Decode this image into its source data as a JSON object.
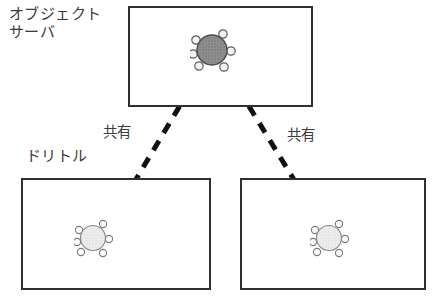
{
  "diagram": {
    "title_labels": {
      "object_server_line1": "オブジェクト",
      "object_server_line2": "サーバ",
      "dolittle": "ドリトル"
    },
    "connection_labels": {
      "left": "共有",
      "right": "共有"
    },
    "boxes": [
      {
        "id": "server",
        "role": "object-server-container",
        "x": 128,
        "y": 6,
        "w": 185,
        "h": 101
      },
      {
        "id": "client-1",
        "role": "dolittle-client-container",
        "x": 21,
        "y": 178,
        "w": 190,
        "h": 112
      },
      {
        "id": "client-2",
        "role": "dolittle-client-container",
        "x": 240,
        "y": 178,
        "w": 186,
        "h": 112
      }
    ],
    "nodes": [
      {
        "id": "server-object",
        "fill": "#8a8a8a",
        "r": 17,
        "satellites": 6,
        "label": "shared-object-master"
      },
      {
        "id": "client-1-object",
        "fill": "#e8e8e8",
        "r": 14,
        "satellites": 6,
        "label": "shared-object-replica"
      },
      {
        "id": "client-2-object",
        "fill": "#e8e8e8",
        "r": 14,
        "satellites": 6,
        "label": "shared-object-replica"
      }
    ],
    "connections": [
      {
        "from": "server-object",
        "to": "client-1-object",
        "style": "dashed",
        "label": "共有",
        "color": "#111111",
        "width": 5
      },
      {
        "from": "server-object",
        "to": "client-2-object",
        "style": "dashed",
        "label": "共有",
        "color": "#111111",
        "width": 5
      }
    ],
    "colors": {
      "background": "#ffffff",
      "box_border": "#303030",
      "text": "#3a3a3a",
      "line": "#111111",
      "node_dark": "#8a8a8a",
      "node_light": "#e8e8e8",
      "node_outline": "#6b6b6b"
    }
  }
}
